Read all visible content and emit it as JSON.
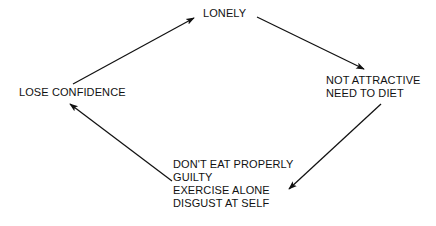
{
  "diagram": {
    "background_color": "#ffffff",
    "ink_color": "#111111",
    "nodes": [
      {
        "id": "lonely",
        "lines": [
          "LONELY"
        ]
      },
      {
        "id": "not_attractive",
        "lines": [
          "NOT ATTRACTIVE",
          "NEED TO DIET"
        ]
      },
      {
        "id": "eating",
        "lines": [
          "DON'T EAT PROPERLY",
          "GUILTY",
          "EXERCISE ALONE",
          "DISGUST AT SELF"
        ]
      },
      {
        "id": "lose_confidence",
        "lines": [
          "LOSE CONFIDENCE"
        ]
      }
    ],
    "edges": [
      {
        "id": "edge-lose-confidence-to-lonely",
        "from": "lose_confidence",
        "to": "lonely",
        "direction": "up-right"
      },
      {
        "id": "edge-lonely-to-not-attractive",
        "from": "lonely",
        "to": "not_attractive",
        "direction": "down-right"
      },
      {
        "id": "edge-not-attractive-to-eating",
        "from": "not_attractive",
        "to": "eating",
        "direction": "down-left"
      },
      {
        "id": "edge-eating-to-lose-confidence",
        "from": "eating",
        "to": "lose_confidence",
        "direction": "up-left"
      }
    ]
  }
}
